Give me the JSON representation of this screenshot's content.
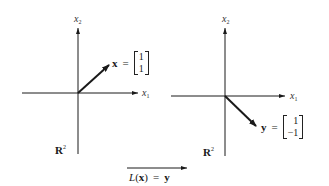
{
  "left_plot": {
    "x1_label": "x",
    "x1_sub": "1",
    "x2_label": "x",
    "x2_sub": "2",
    "space_label": "R",
    "space_sup": "2",
    "vector_name": "x",
    "equals": "=",
    "vector_components": [
      "1",
      "1"
    ]
  },
  "right_plot": {
    "x1_label": "x",
    "x1_sub": "1",
    "x2_label": "x",
    "x2_sub": "2",
    "space_label": "R",
    "space_sup": "2",
    "vector_name": "y",
    "equals": "=",
    "vector_components": [
      "1",
      "−1"
    ]
  },
  "mapping": {
    "func": "L",
    "open": "(",
    "arg": "x",
    "close": ")",
    "equals": "=",
    "result": "y"
  },
  "colors": {
    "ink": "#1a1a1a",
    "background": "#ffffff"
  }
}
